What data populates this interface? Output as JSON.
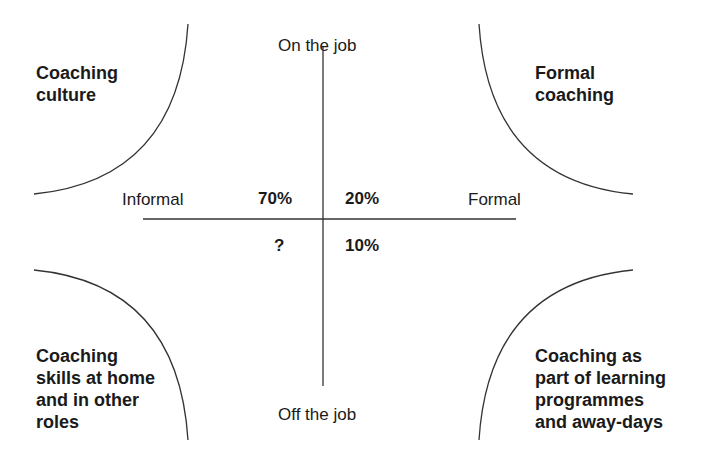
{
  "axes": {
    "top": "On the job",
    "bottom": "Off the job",
    "left": "Informal",
    "right": "Formal"
  },
  "percentages": {
    "top_left": "70%",
    "top_right": "20%",
    "bottom_left": "?",
    "bottom_right": "10%"
  },
  "quadrants": {
    "top_left": {
      "lines": [
        "Coaching",
        "culture"
      ]
    },
    "top_right": {
      "lines": [
        "Formal",
        "coaching"
      ]
    },
    "bottom_left": {
      "lines": [
        "Coaching",
        "skills at home",
        "and in other",
        "roles"
      ]
    },
    "bottom_right": {
      "lines": [
        "Coaching as",
        "part of learning",
        "programmes",
        "and away-days"
      ]
    }
  },
  "colors": {
    "line": "#333333",
    "text": "#1a1a1a",
    "background": "#ffffff"
  }
}
